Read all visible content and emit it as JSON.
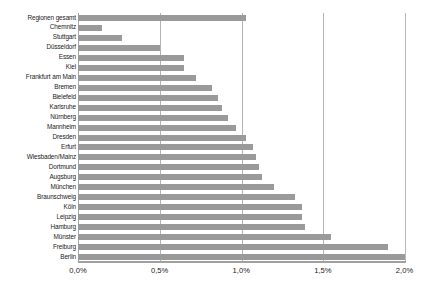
{
  "chart_data": {
    "type": "bar",
    "orientation": "horizontal",
    "title": "",
    "subtitle": "",
    "xlabel": "",
    "ylabel": "",
    "xlim": [
      0,
      2.0
    ],
    "grid": true,
    "legend": false,
    "legend_position": "none",
    "bar_color": "#9a9a9a",
    "gridline_color": "#b3b3b3",
    "value_format": "percent-comma",
    "tick_labels": [
      "0,0%",
      "0,5%",
      "1,0%",
      "1,5%",
      "2,0%"
    ],
    "tick_values": [
      0.0,
      0.5,
      1.0,
      1.5,
      2.0
    ],
    "categories": [
      "Regionen gesamt",
      "Chemnitz",
      "Stuttgart",
      "Düsseldorf",
      "Essen",
      "Kiel",
      "Frankfurt am Main",
      "Bremen",
      "Bielefeld",
      "Karlsruhe",
      "Nürnberg",
      "Mannheim",
      "Dresden",
      "Erfurt",
      "Wiesbaden/Mainz",
      "Dortmund",
      "Augsburg",
      "München",
      "Braunschweig",
      "Köln",
      "Leipzig",
      "Hamburg",
      "Münster",
      "Freiburg",
      "Berlin"
    ],
    "values": [
      1.03,
      0.15,
      0.27,
      0.5,
      0.65,
      0.65,
      0.72,
      0.82,
      0.86,
      0.88,
      0.92,
      0.97,
      1.03,
      1.07,
      1.09,
      1.11,
      1.13,
      1.2,
      1.33,
      1.37,
      1.37,
      1.39,
      1.55,
      1.9,
      2.0
    ]
  }
}
